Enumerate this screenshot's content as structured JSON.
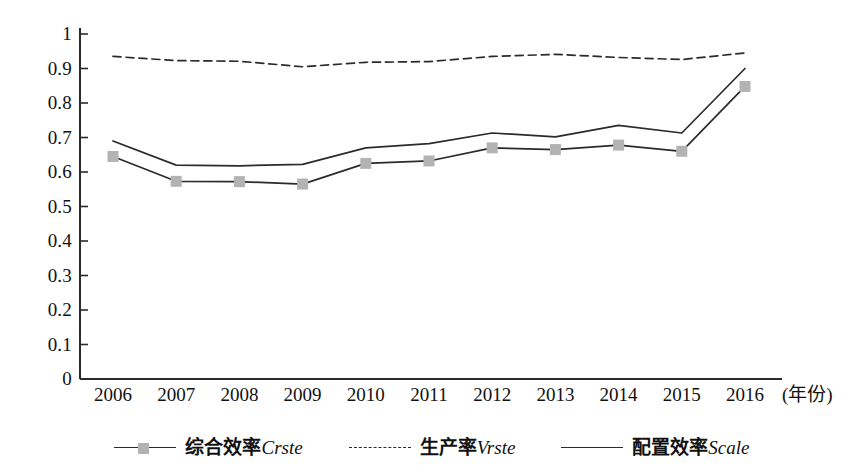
{
  "chart_data": {
    "type": "line",
    "title": "",
    "xlabel": "(年份)",
    "ylabel": "",
    "grid": false,
    "legend_position": "bottom",
    "ylim": [
      0,
      1
    ],
    "ytick_labels": [
      "1",
      "0.9",
      "0.8",
      "0.7",
      "0.6",
      "0.5",
      "0.4",
      "0.3",
      "0.2",
      "0.1",
      "0"
    ],
    "ytick_values": [
      1,
      0.9,
      0.8,
      0.7,
      0.6,
      0.5,
      0.4,
      0.3,
      0.2,
      0.1,
      0
    ],
    "categories": [
      "2006",
      "2007",
      "2008",
      "2009",
      "2010",
      "2011",
      "2012",
      "2013",
      "2014",
      "2015",
      "2016"
    ],
    "series": [
      {
        "name": "综合效率Crste",
        "label_cn": "综合效率",
        "label_term": "Crste",
        "style": "solid-with-markers",
        "color": "#2b2b2b",
        "marker_color": "#b3b3b3",
        "values": [
          0.645,
          0.573,
          0.572,
          0.565,
          0.625,
          0.632,
          0.67,
          0.665,
          0.678,
          0.66,
          0.848
        ]
      },
      {
        "name": "生产率Vrste",
        "label_cn": "生产率",
        "label_term": "Vrste",
        "style": "dashed",
        "color": "#2b2b2b",
        "marker_color": "",
        "values": [
          0.935,
          0.923,
          0.921,
          0.905,
          0.918,
          0.92,
          0.935,
          0.941,
          0.932,
          0.926,
          0.945
        ]
      },
      {
        "name": "配置效率Scale",
        "label_cn": "配置效率",
        "label_term": "Scale",
        "style": "solid",
        "color": "#2b2b2b",
        "marker_color": "",
        "values": [
          0.69,
          0.62,
          0.618,
          0.622,
          0.67,
          0.682,
          0.713,
          0.702,
          0.735,
          0.713,
          0.9
        ]
      }
    ]
  },
  "axis": {
    "unit_label": "(年份)"
  },
  "colors": {
    "axis": "#2b2b2b",
    "line": "#2b2b2b",
    "marker": "#b3b3b3",
    "text": "#111111",
    "background": "#ffffff"
  }
}
